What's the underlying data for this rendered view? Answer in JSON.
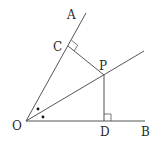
{
  "diagram": {
    "type": "geometry",
    "points": {
      "O": {
        "label": "O",
        "x": 26,
        "y": 121
      },
      "A": {
        "label": "A",
        "x": 86,
        "y": 13
      },
      "B": {
        "label": "B",
        "x": 145,
        "y": 121
      },
      "C": {
        "label": "C",
        "x": 68,
        "y": 46
      },
      "P": {
        "label": "P",
        "x": 104,
        "y": 75
      },
      "D": {
        "label": "D",
        "x": 104,
        "y": 121
      }
    },
    "labels": {
      "A": "A",
      "B": "B",
      "C": "C",
      "P": "P",
      "D": "D",
      "O": "O"
    },
    "segments": [
      {
        "from": "O",
        "to": "A",
        "kind": "ray"
      },
      {
        "from": "O",
        "to": "B",
        "kind": "ray"
      },
      {
        "from": "O",
        "to": "P",
        "kind": "bisector-ray"
      },
      {
        "from": "P",
        "to": "C",
        "kind": "perpendicular"
      },
      {
        "from": "P",
        "to": "D",
        "kind": "perpendicular"
      }
    ],
    "right_angles": [
      "C",
      "D"
    ],
    "equal_angle_marks": [
      "angle AOP",
      "angle POB"
    ],
    "colors": {
      "line": "#555555",
      "text": "#2a2a2a",
      "background": "#ffffff"
    }
  }
}
